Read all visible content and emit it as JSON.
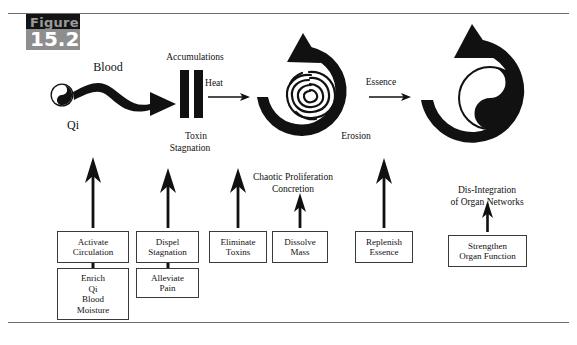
{
  "figure": {
    "word": "Figure",
    "number": "15.2"
  },
  "flow_labels": [
    {
      "text": "Blood",
      "x": 108,
      "y": 68,
      "size": 12
    },
    {
      "text": "Qi",
      "x": 73,
      "y": 126,
      "size": 12
    },
    {
      "text": "Accumulations",
      "x": 195,
      "y": 58,
      "size": 9
    },
    {
      "text": "Heat",
      "x": 212,
      "y": 84,
      "size": 9
    },
    {
      "text": "Toxin",
      "x": 196,
      "y": 137,
      "size": 9
    },
    {
      "text": "Stagnation",
      "x": 192,
      "y": 148,
      "size": 9
    },
    {
      "text": "Erosion",
      "x": 354,
      "y": 137,
      "size": 9
    },
    {
      "text": "Essence",
      "x": 379,
      "y": 83,
      "size": 9
    }
  ],
  "condition_labels": [
    {
      "lines": [
        "Chaotic Proliferation",
        "Concretion"
      ],
      "x": 293,
      "y": 178,
      "size": 9
    },
    {
      "lines": [
        "Dis-Integration",
        "of  Organ Networks"
      ],
      "x": 487,
      "y": 190,
      "size": 9
    }
  ],
  "treatment_boxes": [
    {
      "name": "activate-circulation",
      "lines": [
        "Activate",
        "Circulation"
      ],
      "x": 57,
      "y": 231,
      "w": 72,
      "h": 32
    },
    {
      "name": "enrich-qi-blood-moisture",
      "lines": [
        "Enrich",
        "Qi",
        "Blood",
        "Moisture"
      ],
      "x": 57,
      "y": 268,
      "w": 72,
      "h": 52
    },
    {
      "name": "dispel-stagnation",
      "lines": [
        "Dispel",
        "Stagnation"
      ],
      "x": 136,
      "y": 231,
      "w": 63,
      "h": 32
    },
    {
      "name": "alleviate-pain",
      "lines": [
        "Alleviate",
        "Pain"
      ],
      "x": 136,
      "y": 268,
      "w": 63,
      "h": 30
    },
    {
      "name": "eliminate-toxins",
      "lines": [
        "Eliminate",
        "Toxins"
      ],
      "x": 209,
      "y": 231,
      "w": 58,
      "h": 32
    },
    {
      "name": "dissolve-mass",
      "lines": [
        "Dissolve",
        "Mass"
      ],
      "x": 272,
      "y": 231,
      "w": 56,
      "h": 32
    },
    {
      "name": "replenish-essence",
      "lines": [
        "Replenish",
        "Essence"
      ],
      "x": 355,
      "y": 231,
      "w": 58,
      "h": 32
    },
    {
      "name": "strengthen-organ-function",
      "lines": [
        "Strengthen",
        "Organ Function"
      ],
      "x": 448,
      "y": 235,
      "w": 79,
      "h": 32
    }
  ],
  "symbols": {
    "qi_yinyang": "yin-yang-symbol",
    "accumulation_bars": "two-vertical-bars",
    "erosion_maze": "labyrinth-spiral-symbol",
    "organ_yinyang": "yin-yang-symbol",
    "cycle_arrows": "circular-arrow"
  },
  "colors": {
    "ink": "#111111",
    "rule": "#6d6d6d",
    "badge_dark": "#141414",
    "badge_gray": "#8e8e8e",
    "box_border": "#3a3a3a",
    "page": "#ffffff"
  }
}
